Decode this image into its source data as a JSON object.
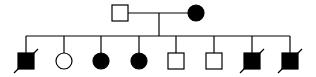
{
  "diagram": {
    "type": "pedigree",
    "colors": {
      "line": "#000000",
      "affected": "#000000",
      "unaffected": "#ffffff"
    },
    "parents": [
      {
        "id": "father",
        "sex": "male",
        "affected": false,
        "deceased": false,
        "cx": 120,
        "cy": 13
      },
      {
        "id": "mother",
        "sex": "female",
        "affected": true,
        "deceased": false,
        "cx": 196,
        "cy": 13
      }
    ],
    "children": [
      {
        "id": "child-1",
        "sex": "male",
        "affected": true,
        "deceased": true,
        "cx": 26
      },
      {
        "id": "child-2",
        "sex": "female",
        "affected": false,
        "deceased": false,
        "cx": 64
      },
      {
        "id": "child-3",
        "sex": "female",
        "affected": true,
        "deceased": false,
        "cx": 101
      },
      {
        "id": "child-4",
        "sex": "female",
        "affected": true,
        "deceased": false,
        "cx": 139
      },
      {
        "id": "child-5",
        "sex": "male",
        "affected": false,
        "deceased": false,
        "cx": 176
      },
      {
        "id": "child-6",
        "sex": "male",
        "affected": false,
        "deceased": false,
        "cx": 214
      },
      {
        "id": "child-7",
        "sex": "male",
        "affected": true,
        "deceased": true,
        "cx": 252
      },
      {
        "id": "child-8",
        "sex": "male",
        "affected": true,
        "deceased": true,
        "cx": 290
      }
    ]
  }
}
